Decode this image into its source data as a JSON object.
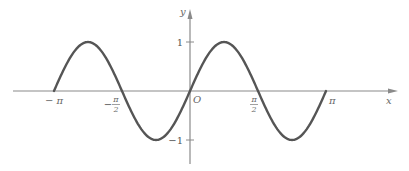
{
  "chart_data": {
    "type": "line",
    "title": "",
    "function": "y = sin(2x)",
    "xlabel": "x",
    "ylabel": "y",
    "origin_label": "O",
    "xlim": [
      -3.7,
      4.9
    ],
    "ylim": [
      -1.5,
      1.7
    ],
    "grid": false,
    "legend": "none",
    "domain": [
      -3.14159,
      3.14159
    ],
    "series": [
      {
        "name": "sin(2x)",
        "x": [
          -3.14159,
          -2.35619,
          -1.5708,
          -0.7854,
          0,
          0.7854,
          1.5708,
          2.35619,
          3.14159
        ],
        "y": [
          0,
          1,
          0,
          -1,
          0,
          1,
          0,
          -1,
          0
        ]
      }
    ],
    "x_ticks": [
      {
        "value": -3.14159,
        "label": "− π",
        "type": "plain"
      },
      {
        "value": -1.5708,
        "label_sign": "−",
        "num": "π",
        "den": "2",
        "type": "fraction"
      },
      {
        "value": 1.5708,
        "label_sign": "",
        "num": "π",
        "den": "2",
        "type": "fraction"
      },
      {
        "value": 3.14159,
        "label": "π",
        "type": "plain"
      }
    ],
    "y_ticks": [
      {
        "value": 1,
        "label": "1"
      },
      {
        "value": -1,
        "label": "−1"
      }
    ]
  }
}
